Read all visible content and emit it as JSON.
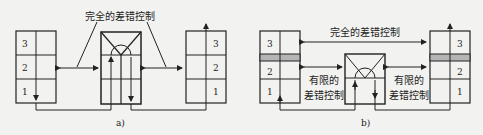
{
  "diagram_a": {
    "title": "完全的差错控制",
    "caption": "a)",
    "left_stack": [
      "3",
      "2",
      "1"
    ],
    "right_stack": [
      "3",
      "2",
      "1"
    ]
  },
  "diagram_b": {
    "top_label": "完全的差错控制",
    "left_label_line1": "有限的",
    "left_label_line2": "差错控制",
    "right_label_line1": "有限的",
    "right_label_line2": "差错控制",
    "caption": "b)",
    "left_stack": [
      "3",
      "2",
      "1"
    ],
    "right_stack": [
      "3",
      "2",
      "1"
    ]
  },
  "colors": {
    "line": "#222222",
    "shaded_layer": "#b5b5b5",
    "background": "#f2f2f0"
  }
}
